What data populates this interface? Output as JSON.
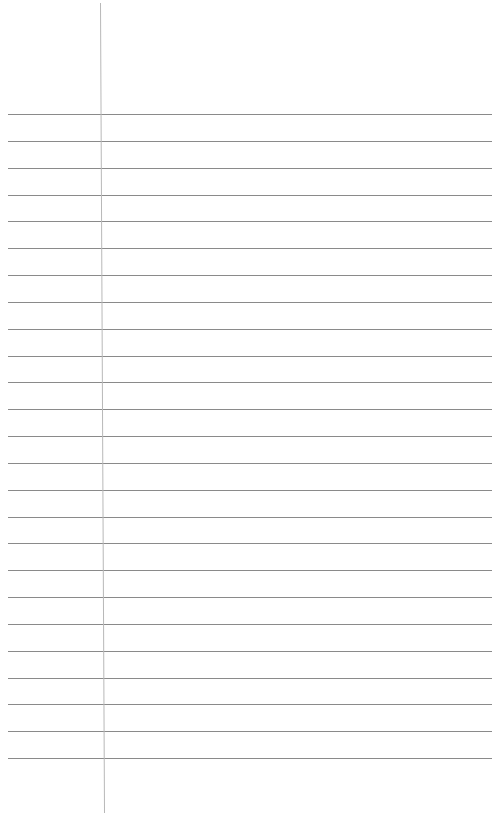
{
  "page": {
    "type": "blank lined paper",
    "width": 495,
    "height": 816,
    "background": "#ffffff"
  },
  "rules": {
    "color": "#8a8a8a",
    "stroke_width": 1,
    "x_start": 8,
    "x_end": 492,
    "first_y": 114,
    "last_y": 758,
    "count": 25
  },
  "margin_line": {
    "color": "#b8b8b8",
    "stroke_width": 1,
    "x_top": 100,
    "y_top": 3,
    "x_bottom": 104,
    "y_bottom": 813
  }
}
